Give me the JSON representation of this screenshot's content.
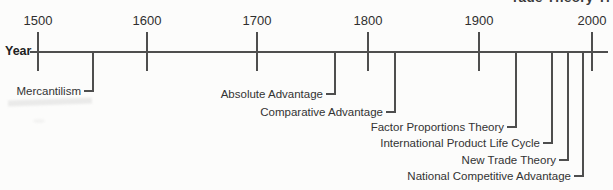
{
  "partial_heading": "rade Theory Ti",
  "colors": {
    "line": "#4e4e4e",
    "text": "#333333",
    "background": "#fcfcfb"
  },
  "axis": {
    "label": "Year",
    "line_y": 51,
    "x_start": 30,
    "x_end": 608,
    "tick_top": 32,
    "tick_bottom": 71,
    "tick_label_top": 13,
    "ticks": [
      {
        "label": "1500",
        "x": 38
      },
      {
        "label": "1600",
        "x": 147
      },
      {
        "label": "1700",
        "x": 257
      },
      {
        "label": "1800",
        "x": 368
      },
      {
        "label": "1900",
        "x": 479
      },
      {
        "label": "2000",
        "x": 592
      }
    ]
  },
  "events": [
    {
      "label": "Mercantilism",
      "x": 93,
      "y": 91
    },
    {
      "label": "Absolute Advantage",
      "x": 335,
      "y": 94
    },
    {
      "label": "Comparative Advantage",
      "x": 395,
      "y": 112
    },
    {
      "label": "Factor Proportions Theory",
      "x": 516,
      "y": 127
    },
    {
      "label": "International Product Life Cycle",
      "x": 552,
      "y": 143
    },
    {
      "label": "New Trade Theory",
      "x": 568,
      "y": 160
    },
    {
      "label": "National Competitive Advantage",
      "x": 583,
      "y": 176
    }
  ]
}
